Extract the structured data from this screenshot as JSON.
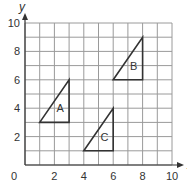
{
  "diagram": {
    "type": "coordinate-grid",
    "x_axis": {
      "label": "x",
      "min": 0,
      "max": 10,
      "ticks": [
        "0",
        "2",
        "4",
        "6",
        "8",
        "10"
      ]
    },
    "y_axis": {
      "label": "y",
      "min": 0,
      "max": 10,
      "ticks": [
        "2",
        "4",
        "6",
        "8",
        "10"
      ]
    },
    "origin_label": "0",
    "grid_step": 1,
    "colors": {
      "grid": "#9a9a9a",
      "shape": "#333333",
      "text": "#333333"
    },
    "triangles": [
      {
        "label": "A",
        "vertices": [
          [
            1,
            3
          ],
          [
            3,
            3
          ],
          [
            3,
            6
          ]
        ],
        "label_pos": [
          2.4,
          3.7
        ]
      },
      {
        "label": "B",
        "vertices": [
          [
            6,
            6
          ],
          [
            8,
            6
          ],
          [
            8,
            9
          ]
        ],
        "label_pos": [
          7.4,
          6.7
        ]
      },
      {
        "label": "C",
        "vertices": [
          [
            4,
            1
          ],
          [
            6,
            1
          ],
          [
            6,
            4
          ]
        ],
        "label_pos": [
          5.4,
          1.7
        ]
      }
    ]
  }
}
